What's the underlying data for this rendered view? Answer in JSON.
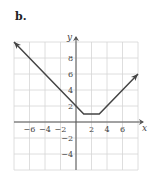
{
  "figure": {
    "label": "b."
  },
  "chart_data": {
    "type": "line",
    "title": "",
    "xlabel": "x",
    "ylabel": "y",
    "xlim": [
      -8,
      8
    ],
    "ylim": [
      -6,
      10
    ],
    "grid": true,
    "grid_step": 2,
    "x_ticks": [
      -6,
      -4,
      -2,
      2,
      4,
      6
    ],
    "y_ticks": [
      8,
      6,
      4,
      2,
      -2,
      -4
    ],
    "series": [
      {
        "name": "graph",
        "points": [
          [
            -8,
            10
          ],
          [
            0,
            2
          ],
          [
            1,
            1
          ],
          [
            3,
            1
          ],
          [
            8,
            6
          ]
        ],
        "arrows": "both",
        "color": "#444444"
      }
    ]
  }
}
